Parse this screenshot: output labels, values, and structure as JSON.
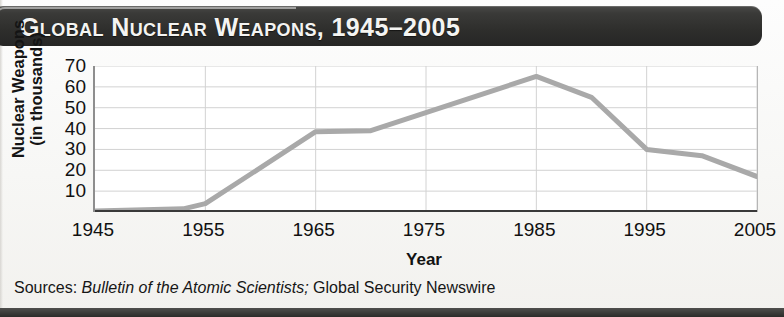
{
  "title": "Global Nuclear Weapons, 1945–2005",
  "source": {
    "prefix": "Sources:",
    "italic": "Bulletin of the Atomic Scientists;",
    "rest": "Global Security Newswire"
  },
  "colors": {
    "banner": "#2e2e2c",
    "title_text": "#f4f4f2",
    "line": "#a9a9a9",
    "grid": "#d2d2d2",
    "axis": "#6f6f6f",
    "text": "#111111"
  },
  "chart_data": {
    "type": "line",
    "title": "Global Nuclear Weapons, 1945–2005",
    "xlabel": "Year",
    "ylabel": "Nuclear Weapons (in thousands)",
    "ylabel_line1": "Nuclear Weapons",
    "ylabel_line2": "(in thousands)",
    "xlim": [
      1945,
      2005
    ],
    "ylim": [
      0,
      70
    ],
    "yticks": [
      70,
      60,
      50,
      40,
      30,
      20,
      10
    ],
    "ytick_labels": [
      "70",
      "60",
      "50",
      "40",
      "30",
      "20",
      "10"
    ],
    "xticks": [
      1945,
      1955,
      1965,
      1975,
      1985,
      1995,
      2005
    ],
    "xtick_labels": [
      "1945",
      "1955",
      "1965",
      "1975",
      "1985",
      "1995",
      "2005"
    ],
    "grid": true,
    "legend": null,
    "series": [
      {
        "name": "Global nuclear weapons",
        "x": [
          1945,
          1953,
          1955,
          1965,
          1970,
          1985,
          1990,
          1995,
          2000,
          2005
        ],
        "values": [
          0.5,
          1.5,
          4,
          38.5,
          39,
          65,
          55,
          30,
          27,
          17
        ]
      }
    ]
  }
}
